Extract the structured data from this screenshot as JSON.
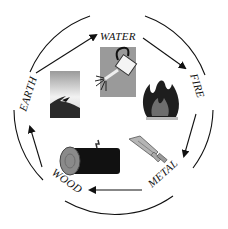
{
  "diagram": {
    "nodes": [
      {
        "id": "water",
        "label": "WATER",
        "icon": "watering-can-icon"
      },
      {
        "id": "fire",
        "label": "FIRE",
        "icon": "flame-icon"
      },
      {
        "id": "metal",
        "label": "METAL",
        "icon": "sword-icon"
      },
      {
        "id": "wood",
        "label": "WOOD",
        "icon": "log-icon"
      },
      {
        "id": "earth",
        "label": "EARTH",
        "icon": "sand-dune-icon"
      }
    ],
    "edges": [
      {
        "from": "earth",
        "to": "water"
      },
      {
        "from": "water",
        "to": "fire"
      },
      {
        "from": "fire",
        "to": "metal"
      },
      {
        "from": "metal",
        "to": "wood"
      },
      {
        "from": "wood",
        "to": "earth"
      }
    ],
    "colors": {
      "line": "#111111",
      "dark": "#1a1a1a",
      "gray": "#8c8c8c",
      "light_gray": "#c8c8c8",
      "background": "#ffffff"
    }
  }
}
